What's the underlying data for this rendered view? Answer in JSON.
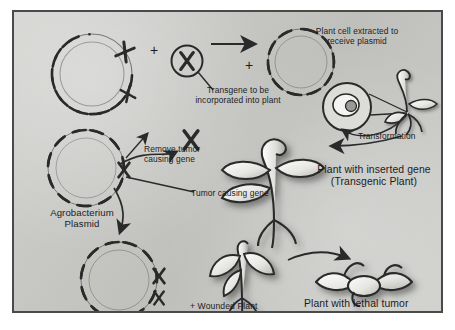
{
  "figure": {
    "background_color": "#c9c9c6",
    "border_color": "#4a4a4a",
    "ink_color": "#2a2a2a",
    "text_color": "#1c1c1c"
  },
  "labels": {
    "transgene": "Transgene to be\nincorporated into plant",
    "plant_cell": "Plant cell extracted to\nreceive plasmid",
    "transformation": "Transformation",
    "remove_tumor": "Remove tumor\ncausing gene",
    "tumor_gene": "Tumor causing gene",
    "agro_plasmid": "Agrobacterium\nPlasmid",
    "transgenic_plant": "Plant with inserted gene\n(Transgenic Plant)",
    "wounded_plant": "+ Wounded Plant",
    "lethal_tumor": "Plant with lethal tumor",
    "plus_top": "+",
    "plus_right": "+"
  },
  "icons": {
    "plasmid": "plasmid-dna-circle-icon",
    "transgene": "chromosome-icon",
    "cell": "plant-cell-nucleus-icon",
    "seedling": "seedling-icon",
    "plant": "transgenic-plant-icon",
    "wounded": "wounded-plant-icon",
    "tumor": "tumor-plant-icon",
    "arrow": "arrow-icon"
  }
}
